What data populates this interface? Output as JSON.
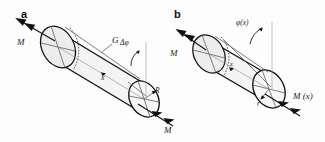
{
  "figure": {
    "background_color": "#fdfdfd",
    "line_color": "#111111",
    "panels": [
      {
        "id": "a",
        "letter": "a",
        "description": "Full-length shaft of radius R twisted by end moments M, showing total twist angle delta-phi and shear modulus G",
        "labels": {
          "moment_left": "M",
          "moment_right": "M",
          "shear_modulus": "G",
          "twist_angle": "Δφ",
          "axis": "x",
          "radius": "R"
        }
      },
      {
        "id": "b",
        "letter": "b",
        "description": "Shaft segment of length x and inner radius r twisted by moment M and internal moment M(x), showing twist angle phi(x)",
        "labels": {
          "moment_left": "M",
          "twist_angle": "φ(x)",
          "axis": "x",
          "radius": "r",
          "internal_moment": "M (x)"
        }
      }
    ]
  }
}
